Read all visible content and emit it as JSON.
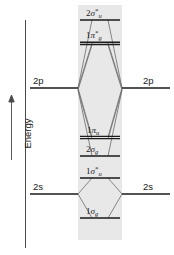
{
  "diagram": {
    "axis": {
      "label": "Energy",
      "arrow_direction": "up",
      "arrow_glyph": "↑"
    },
    "band": {
      "fill_color": "#e8e8e8",
      "x": 78,
      "y": 5,
      "width": 44,
      "height": 235
    },
    "colors": {
      "level_line": "#1a1a1a",
      "correlation_line": "#5a5a5a",
      "axis_line": "#4a4a4a",
      "text": "#1a1a1a",
      "band": "#e8e8e8"
    },
    "atomic_orbitals": {
      "left": [
        {
          "label": "2p",
          "y": 88,
          "x1": 30,
          "x2": 78
        },
        {
          "label": "2s",
          "y": 194,
          "x1": 30,
          "x2": 78
        }
      ],
      "right": [
        {
          "label": "2p",
          "y": 88,
          "x1": 122,
          "x2": 170
        },
        {
          "label": "2s",
          "y": 194,
          "x1": 122,
          "x2": 170
        }
      ]
    },
    "molecular_orbitals": [
      {
        "name": "2-sigma-u-star",
        "num": "2",
        "greek": "σ",
        "star": "*",
        "sub": "u",
        "y": 20,
        "doubled": false,
        "bold": false
      },
      {
        "name": "1-pi-g-star",
        "num": "1",
        "greek": "π",
        "star": "*",
        "sub": "g",
        "y": 43,
        "doubled": true,
        "bold": true
      },
      {
        "name": "1-pi-u",
        "num": "1",
        "greek": "π",
        "star": "",
        "sub": "u",
        "y": 137,
        "doubled": true,
        "bold": false
      },
      {
        "name": "2-sigma-g",
        "num": "2",
        "greek": "σ",
        "star": "",
        "sub": "g",
        "y": 156,
        "doubled": false,
        "bold": false
      },
      {
        "name": "1-sigma-u-star",
        "num": "1",
        "greek": "σ",
        "star": "*",
        "sub": "u",
        "y": 178,
        "doubled": false,
        "bold": false
      },
      {
        "name": "1-sigma-g",
        "num": "1",
        "greek": "σ",
        "star": "",
        "sub": "g",
        "y": 218,
        "doubled": false,
        "bold": false
      }
    ]
  }
}
